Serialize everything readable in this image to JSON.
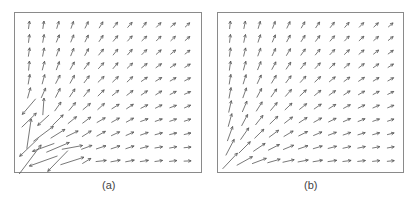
{
  "figure": {
    "panels": [
      {
        "id": "a",
        "label": "(a)",
        "box": {
          "x": 14,
          "y": 12,
          "w": 188,
          "h": 161
        },
        "label_pos": {
          "x": 102,
          "y": 179
        },
        "grid": {
          "cols": 12,
          "rows": 11,
          "x0": 14,
          "dx": 14.4,
          "y0": 12,
          "dy": 13.6
        },
        "field": "noisy",
        "stroke": "#555555"
      },
      {
        "id": "b",
        "label": "(b)",
        "box": {
          "x": 217,
          "y": 12,
          "w": 187,
          "h": 161
        },
        "label_pos": {
          "x": 304,
          "y": 179
        },
        "grid": {
          "cols": 12,
          "rows": 11,
          "x0": 12,
          "dx": 14.6,
          "y0": 12,
          "dy": 13.6
        },
        "field": "smooth",
        "stroke": "#555555"
      }
    ]
  },
  "chart_data": {
    "type": "quiver",
    "title": "",
    "panels": [
      {
        "label": "(a)",
        "description": "Noisy/estimated vector field; arrows point up near left column, rotate to rightward near bottom row; large erratic arrows (including leftward/downward ones) cluster near the bottom-left corner",
        "grid": {
          "cols": 12,
          "rows": 11
        }
      },
      {
        "label": "(b)",
        "description": "Smooth vector field radiating from bottom-left corner; arrows point up along left edge, diagonal in middle, rightward along bottom; magnitude largest near the corner",
        "grid": {
          "cols": 12,
          "rows": 11
        }
      }
    ]
  }
}
